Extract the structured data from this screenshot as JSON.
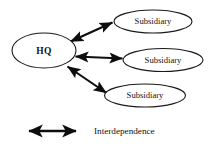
{
  "diagram": {
    "type": "organizational-relationship-diagram",
    "background_color": "#ffffff",
    "line_color": "#0d0d0d",
    "text_color": "#111111",
    "nodes": [
      {
        "id": "hq",
        "label": "HQ",
        "shape": "ellipse",
        "emphasis": "bold"
      },
      {
        "id": "sub1",
        "label": "Subsidiary",
        "shape": "ellipse",
        "emphasis": "normal"
      },
      {
        "id": "sub2",
        "label": "Subsidiary",
        "shape": "ellipse",
        "emphasis": "normal"
      },
      {
        "id": "sub3",
        "label": "Subsidiary",
        "shape": "ellipse",
        "emphasis": "normal"
      }
    ],
    "links": [
      {
        "from": "hq",
        "to": "sub1",
        "style": "double-headed-arrow"
      },
      {
        "from": "hq",
        "to": "sub2",
        "style": "double-headed-arrow"
      },
      {
        "from": "hq",
        "to": "sub3",
        "style": "double-headed-arrow"
      }
    ],
    "legend": {
      "symbol": "double-headed-arrow",
      "label": "Interdependence"
    }
  }
}
